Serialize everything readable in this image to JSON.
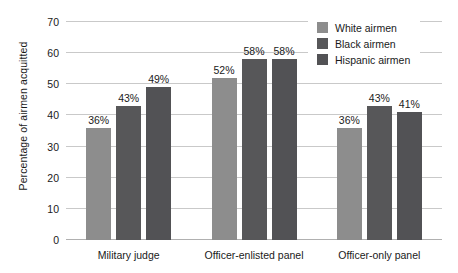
{
  "chart_data": {
    "type": "bar",
    "title": "",
    "xlabel": "",
    "ylabel": "Percentage of airmen acquitted",
    "ylim": [
      0,
      70
    ],
    "ytick_step": 10,
    "yticks": [
      0,
      10,
      20,
      30,
      40,
      50,
      60,
      70
    ],
    "ytick_labels": [
      "0",
      "10",
      "20",
      "30",
      "40",
      "50",
      "60",
      "70"
    ],
    "grid": true,
    "legend_position": "top-right",
    "value_label_suffix": "%",
    "categories": [
      "Military judge",
      "Officer-enlisted panel",
      "Officer-only panel"
    ],
    "series": [
      {
        "name": "White airmen",
        "color": "#8d8d8d",
        "values": [
          36,
          52,
          36
        ],
        "value_labels": [
          "36%",
          "52%",
          "36%"
        ]
      },
      {
        "name": "Black airmen",
        "color": "#575759",
        "values": [
          43,
          58,
          43
        ],
        "value_labels": [
          "43%",
          "58%",
          "43%"
        ]
      },
      {
        "name": "Hispanic airmen",
        "color": "#525255",
        "values": [
          49,
          58,
          41
        ],
        "value_labels": [
          "49%",
          "58%",
          "41%"
        ]
      }
    ]
  },
  "legend": {
    "items": [
      {
        "label": "White airmen",
        "color": "#8d8d8d"
      },
      {
        "label": "Black airmen",
        "color": "#575759"
      },
      {
        "label": "Hispanic airmen",
        "color": "#525255"
      }
    ]
  }
}
